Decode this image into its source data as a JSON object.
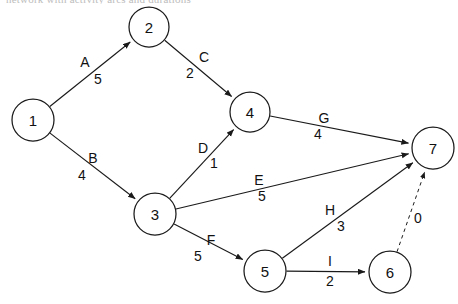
{
  "diagram": {
    "title_cropped": "network with activity arcs and durations",
    "type": "activity-on-arc network",
    "width": 458,
    "height": 304,
    "background_color": "#ffffff",
    "stroke_color": "#1a1a1a",
    "node_radius": 21,
    "nodes": [
      {
        "id": "1",
        "label": "1",
        "cx": 33,
        "cy": 120,
        "r": 21
      },
      {
        "id": "2",
        "label": "2",
        "cx": 149,
        "cy": 27,
        "r": 20
      },
      {
        "id": "3",
        "label": "3",
        "cx": 155,
        "cy": 214,
        "r": 21
      },
      {
        "id": "4",
        "label": "4",
        "cx": 250,
        "cy": 112,
        "r": 20
      },
      {
        "id": "5",
        "label": "5",
        "cx": 265,
        "cy": 271,
        "r": 21
      },
      {
        "id": "6",
        "label": "6",
        "cx": 390,
        "cy": 272,
        "r": 21
      },
      {
        "id": "7",
        "label": "7",
        "cx": 433,
        "cy": 148,
        "r": 21
      }
    ],
    "edges": [
      {
        "id": "A",
        "name": "A",
        "weight": "5",
        "from": "1",
        "to": "2",
        "style": "solid",
        "name_x": 85,
        "name_y": 62,
        "weight_x": 98,
        "weight_y": 79
      },
      {
        "id": "B",
        "name": "B",
        "weight": "4",
        "from": "1",
        "to": "3",
        "style": "solid",
        "name_x": 93,
        "name_y": 158,
        "weight_x": 82,
        "weight_y": 175
      },
      {
        "id": "C",
        "name": "C",
        "weight": "2",
        "from": "2",
        "to": "4",
        "style": "solid",
        "name_x": 204,
        "name_y": 57,
        "weight_x": 190,
        "weight_y": 73
      },
      {
        "id": "D",
        "name": "D",
        "weight": "1",
        "from": "3",
        "to": "4",
        "style": "solid",
        "name_x": 203,
        "name_y": 148,
        "weight_x": 214,
        "weight_y": 163
      },
      {
        "id": "E",
        "name": "E",
        "weight": "5",
        "from": "3",
        "to": "7",
        "style": "solid",
        "name_x": 259,
        "name_y": 180,
        "weight_x": 262,
        "weight_y": 196
      },
      {
        "id": "F",
        "name": "F",
        "weight": "5",
        "from": "3",
        "to": "5",
        "style": "solid",
        "name_x": 211,
        "name_y": 240,
        "weight_x": 198,
        "weight_y": 256
      },
      {
        "id": "G",
        "name": "G",
        "weight": "4",
        "from": "4",
        "to": "7",
        "style": "solid",
        "name_x": 324,
        "name_y": 118,
        "weight_x": 318,
        "weight_y": 134
      },
      {
        "id": "H",
        "name": "H",
        "weight": "3",
        "from": "5",
        "to": "7",
        "style": "solid",
        "name_x": 330,
        "name_y": 210,
        "weight_x": 341,
        "weight_y": 226
      },
      {
        "id": "I",
        "name": "I",
        "weight": "2",
        "from": "5",
        "to": "6",
        "style": "solid",
        "name_x": 330,
        "name_y": 261,
        "weight_x": 330,
        "weight_y": 281
      },
      {
        "id": "dummy",
        "name": "",
        "weight": "0",
        "from": "6",
        "to": "7",
        "style": "dashed",
        "name_x": 0,
        "name_y": 0,
        "weight_x": 418,
        "weight_y": 218
      }
    ]
  }
}
